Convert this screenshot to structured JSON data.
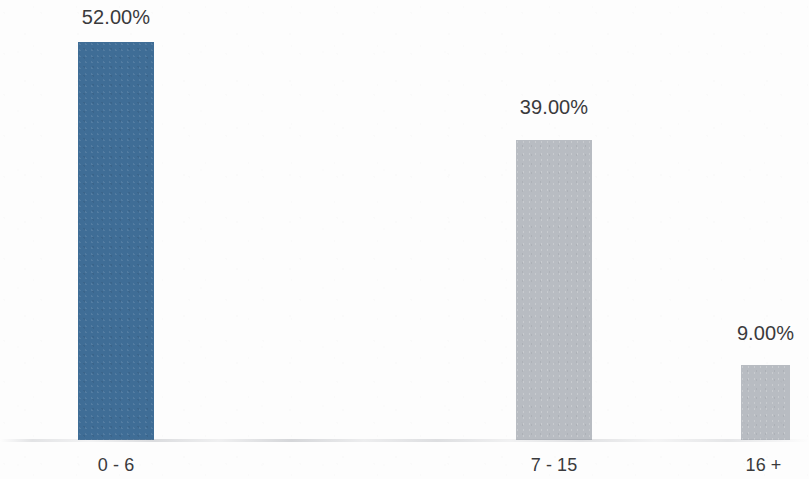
{
  "chart_data": {
    "type": "bar",
    "title": "",
    "subtitle": "",
    "xlabel": "",
    "ylabel": "",
    "categories": [
      "0 - 6",
      "7 - 15",
      "16 +"
    ],
    "values": [
      52.0,
      39.0,
      9.0
    ],
    "value_labels": [
      "52.00%",
      "39.00%",
      "9.00%"
    ],
    "series": [
      {
        "name": "",
        "values": [
          52.0,
          39.0,
          9.0
        ]
      }
    ],
    "colors": [
      "#3f6d96",
      "#b8bcc2",
      "#b8bcc2"
    ],
    "ylim": [
      0,
      57.5
    ],
    "grid": false,
    "legend": "none",
    "axis_lines": false,
    "units": "percent"
  },
  "bars": [
    {
      "category": "0 - 6",
      "value_label": "52.00%",
      "color": "#3f6d96",
      "left": 78,
      "width": 76,
      "top": 42,
      "height": 398,
      "label_left": 78,
      "label_width": 76,
      "label_top": 6,
      "cat_left": 48,
      "cat_width": 136,
      "cat_top": 455
    },
    {
      "category": "7 - 15",
      "value_label": "39.00%",
      "color": "#b8bcc2",
      "left": 516,
      "width": 76,
      "top": 140,
      "height": 300,
      "label_left": 516,
      "label_width": 76,
      "label_top": 96,
      "cat_left": 486,
      "cat_width": 136,
      "cat_top": 455
    },
    {
      "category": "16 +",
      "value_label": "9.00%",
      "color": "#b8bcc2",
      "left": 741,
      "width": 49,
      "top": 365,
      "height": 75,
      "label_left": 724,
      "label_width": 83,
      "label_top": 322,
      "cat_left": 718,
      "cat_width": 91,
      "cat_top": 455
    }
  ],
  "layout": {
    "baseline_y": 440,
    "background": "#fdfdfd",
    "text_color": "#3a3a3c"
  }
}
